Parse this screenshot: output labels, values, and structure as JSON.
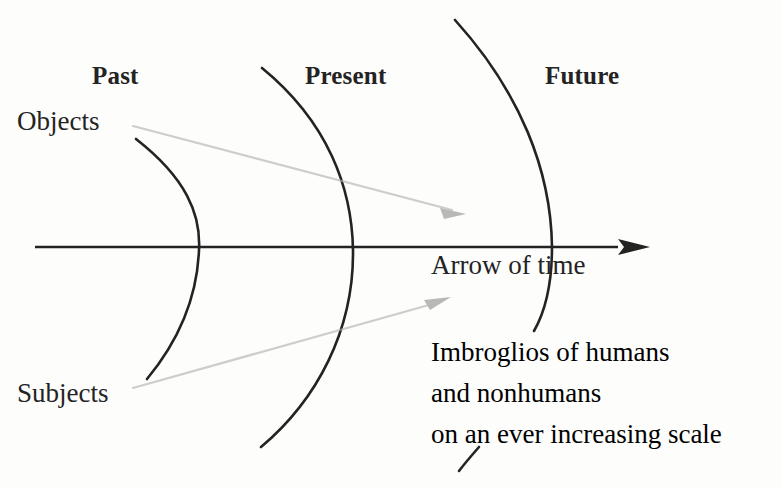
{
  "diagram": {
    "background_color": "#fdfdfc",
    "ink_color": "#232323",
    "faint_arrow_color": "#b9b9b9",
    "era_labels": [
      {
        "name": "past",
        "text": "Past"
      },
      {
        "name": "present",
        "text": "Present"
      },
      {
        "name": "future",
        "text": "Future"
      }
    ],
    "side_labels": [
      {
        "name": "objects",
        "text": "Objects"
      },
      {
        "name": "subjects",
        "text": "Subjects"
      }
    ],
    "axis": {
      "label": "Arrow of time",
      "direction": "left-to-right",
      "arrowhead": "solid-triangle-right"
    },
    "caption": {
      "lines": [
        "Imbroglios of humans",
        "and nonhumans",
        "on an ever increasing scale"
      ]
    },
    "wavefronts": [
      {
        "name": "past-front",
        "description": "innermost arc"
      },
      {
        "name": "present-front",
        "description": "middle arc"
      },
      {
        "name": "future-front",
        "description": "outermost arc"
      }
    ],
    "faint_arrows": [
      {
        "name": "objects-arrow",
        "from": "Objects",
        "direction": "down-right"
      },
      {
        "name": "subjects-arrow",
        "from": "Subjects",
        "direction": "up-right"
      }
    ]
  }
}
